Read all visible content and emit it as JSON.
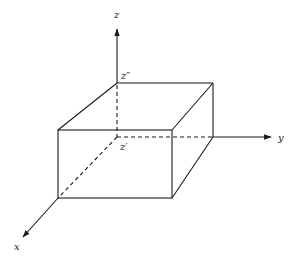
{
  "diagram": {
    "type": "3d-box-on-axes",
    "axes": {
      "x": {
        "label": "x"
      },
      "y": {
        "label": "y"
      },
      "z": {
        "label": "z"
      }
    },
    "points": {
      "z_double_prime": {
        "label": "z″"
      },
      "z_prime": {
        "label": "z′"
      }
    },
    "colors": {
      "stroke": "#1a1a1a",
      "background": "#ffffff"
    }
  }
}
